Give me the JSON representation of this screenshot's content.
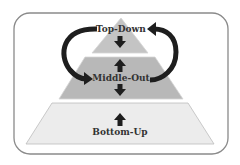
{
  "diagram": {
    "type": "pyramid",
    "levels": [
      {
        "id": "top",
        "label": "Top-Down",
        "fill": "#c4c4c4"
      },
      {
        "id": "middle",
        "label": "Middle-Out",
        "fill": "#b8b8b8"
      },
      {
        "id": "bottom",
        "label": "Bottom-Up",
        "fill": "#ececec"
      }
    ],
    "arrows": {
      "top_level": [
        "down"
      ],
      "middle_level": [
        "up",
        "down"
      ],
      "bottom_level": [
        "up"
      ],
      "curved": [
        "left: Top-Down to Middle-Out",
        "right: Middle-Out to Top-Down"
      ]
    },
    "colors": {
      "border": "#8a8a8a",
      "arrow": "#1e1e1e",
      "outline": "#bdbdbd"
    }
  }
}
